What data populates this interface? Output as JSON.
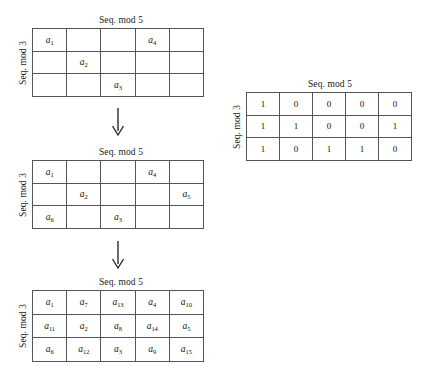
{
  "figure": {
    "background_color": "#ffffff",
    "line_color": "#555555",
    "text_color": "#1a1a1a"
  },
  "axis_labels": {
    "columns": "Seq. mod 5",
    "rows": "Seq. mod 3"
  },
  "panels": [
    {
      "id": "grid-step-1",
      "col_title": "Seq. mod 5",
      "row_title": "Seq. mod 3",
      "rows": 3,
      "cols": 5,
      "cells": [
        [
          "a1",
          "",
          "",
          "a4",
          ""
        ],
        [
          "",
          "a2",
          "",
          "",
          ""
        ],
        [
          "",
          "",
          "a3",
          "",
          ""
        ]
      ]
    },
    {
      "id": "grid-step-2",
      "col_title": "Seq. mod 5",
      "row_title": "Seq. mod 3",
      "rows": 3,
      "cols": 5,
      "cells": [
        [
          "a1",
          "",
          "",
          "a4",
          ""
        ],
        [
          "",
          "a2",
          "",
          "",
          "a5"
        ],
        [
          "a6",
          "",
          "a3",
          "",
          ""
        ]
      ]
    },
    {
      "id": "grid-step-3",
      "col_title": "Seq. mod 5",
      "row_title": "Seq. mod 3",
      "rows": 3,
      "cols": 5,
      "cells": [
        [
          "a1",
          "a7",
          "a13",
          "a4",
          "a10"
        ],
        [
          "a11",
          "a2",
          "a8",
          "a14",
          "a5"
        ],
        [
          "a6",
          "a12",
          "a3",
          "a9",
          "a15"
        ]
      ]
    },
    {
      "id": "grid-occupancy-matrix",
      "col_title": "Seq. mod 5",
      "row_title": "Seq. mod 3",
      "rows": 3,
      "cols": 5,
      "cells": [
        [
          "1",
          "0",
          "0",
          "0",
          "0"
        ],
        [
          "1",
          "1",
          "0",
          "0",
          "1"
        ],
        [
          "1",
          "0",
          "1",
          "1",
          "0"
        ]
      ]
    }
  ],
  "arrows": [
    {
      "id": "arrow-1",
      "direction": "down",
      "glyph": "downward-arrow"
    },
    {
      "id": "arrow-2",
      "direction": "down",
      "glyph": "downward-arrow"
    }
  ]
}
